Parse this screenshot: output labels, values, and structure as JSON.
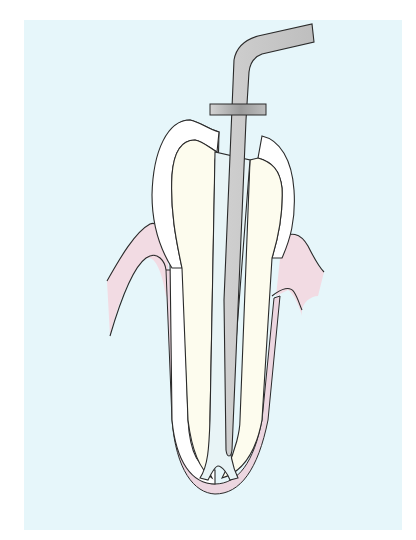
{
  "figure": {
    "colors": {
      "page_background": "#ffffff",
      "panel_background": "#e6f6fa",
      "outline": "#2a2a2a",
      "enamel": "#ffffff",
      "dentin": "#fdfcee",
      "pulp_canal": "#e8f4f6",
      "file": "#c9c9c9",
      "rubber_stop": "#a8a8a8",
      "gingiva": "#f2dbe3",
      "periodontal_ligament": "#ecd6e0"
    },
    "parts": [
      {
        "id": "endodontic-file",
        "label": "Endodontic file"
      },
      {
        "id": "rubber-stop",
        "label": "Rubber stop"
      },
      {
        "id": "enamel",
        "label": "Enamel"
      },
      {
        "id": "dentin",
        "label": "Dentin"
      },
      {
        "id": "root-canal",
        "label": "Root canal"
      },
      {
        "id": "gingiva",
        "label": "Gingiva"
      },
      {
        "id": "periodontal-ligament",
        "label": "Periodontal ligament"
      }
    ]
  }
}
